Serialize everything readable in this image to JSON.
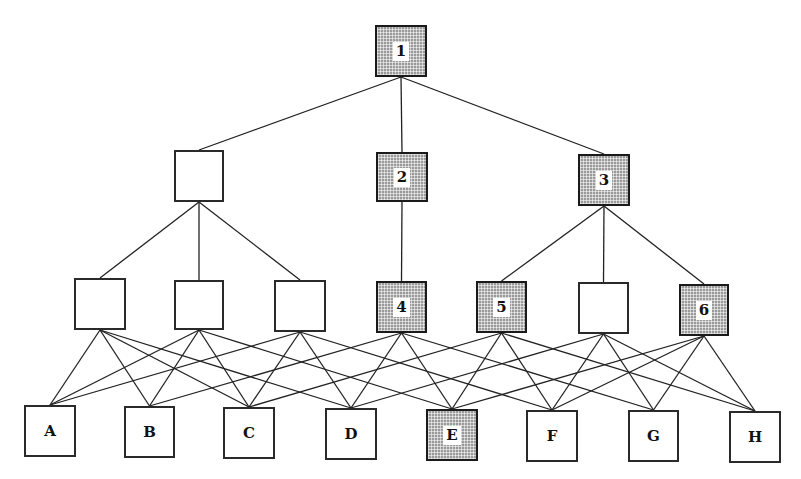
{
  "diagram": {
    "type": "hierarchy-graph",
    "colors": {
      "line": "#222222",
      "node_border": "#2a2a2a",
      "shaded_fill": "#9a9a9a",
      "plain_fill": "#ffffff"
    },
    "nodes": [
      {
        "id": "n1",
        "label": "1",
        "shaded": true,
        "x": 375,
        "y": 25,
        "w": 52,
        "h": 52
      },
      {
        "id": "m0",
        "label": "",
        "shaded": false,
        "x": 174,
        "y": 150,
        "w": 50,
        "h": 52
      },
      {
        "id": "n2",
        "label": "2",
        "shaded": true,
        "x": 376,
        "y": 152,
        "w": 52,
        "h": 50
      },
      {
        "id": "n3",
        "label": "3",
        "shaded": true,
        "x": 578,
        "y": 154,
        "w": 52,
        "h": 52
      },
      {
        "id": "l0",
        "label": "",
        "shaded": false,
        "x": 74,
        "y": 278,
        "w": 52,
        "h": 52
      },
      {
        "id": "l1",
        "label": "",
        "shaded": false,
        "x": 174,
        "y": 280,
        "w": 50,
        "h": 50
      },
      {
        "id": "l2",
        "label": "",
        "shaded": false,
        "x": 274,
        "y": 280,
        "w": 52,
        "h": 52
      },
      {
        "id": "n4",
        "label": "4",
        "shaded": true,
        "x": 376,
        "y": 281,
        "w": 51,
        "h": 52
      },
      {
        "id": "n5",
        "label": "5",
        "shaded": true,
        "x": 476,
        "y": 281,
        "w": 51,
        "h": 52
      },
      {
        "id": "l5",
        "label": "",
        "shaded": false,
        "x": 578,
        "y": 282,
        "w": 51,
        "h": 52
      },
      {
        "id": "n6",
        "label": "6",
        "shaded": true,
        "x": 679,
        "y": 284,
        "w": 50,
        "h": 52
      },
      {
        "id": "A",
        "label": "A",
        "shaded": false,
        "x": 24,
        "y": 405,
        "w": 52,
        "h": 52
      },
      {
        "id": "B",
        "label": "B",
        "shaded": false,
        "x": 124,
        "y": 406,
        "w": 51,
        "h": 52
      },
      {
        "id": "C",
        "label": "C",
        "shaded": false,
        "x": 223,
        "y": 407,
        "w": 52,
        "h": 52
      },
      {
        "id": "D",
        "label": "D",
        "shaded": false,
        "x": 325,
        "y": 408,
        "w": 52,
        "h": 52
      },
      {
        "id": "E",
        "label": "E",
        "shaded": true,
        "x": 426,
        "y": 409,
        "w": 52,
        "h": 52
      },
      {
        "id": "F",
        "label": "F",
        "shaded": false,
        "x": 526,
        "y": 410,
        "w": 52,
        "h": 52
      },
      {
        "id": "G",
        "label": "G",
        "shaded": false,
        "x": 628,
        "y": 410,
        "w": 51,
        "h": 52
      },
      {
        "id": "H",
        "label": "H",
        "shaded": false,
        "x": 729,
        "y": 411,
        "w": 52,
        "h": 52
      }
    ],
    "edges": [
      [
        "n1",
        "m0"
      ],
      [
        "n1",
        "n2"
      ],
      [
        "n1",
        "n3"
      ],
      [
        "m0",
        "l0"
      ],
      [
        "m0",
        "l1"
      ],
      [
        "m0",
        "l2"
      ],
      [
        "n2",
        "n4"
      ],
      [
        "n3",
        "n5"
      ],
      [
        "n3",
        "l5"
      ],
      [
        "n3",
        "n6"
      ],
      [
        "l0",
        "A"
      ],
      [
        "l0",
        "B"
      ],
      [
        "l0",
        "C"
      ],
      [
        "l0",
        "D"
      ],
      [
        "l1",
        "A"
      ],
      [
        "l1",
        "B"
      ],
      [
        "l1",
        "C"
      ],
      [
        "l1",
        "E"
      ],
      [
        "l2",
        "A"
      ],
      [
        "l2",
        "C"
      ],
      [
        "l2",
        "D"
      ],
      [
        "l2",
        "F"
      ],
      [
        "n4",
        "B"
      ],
      [
        "n4",
        "D"
      ],
      [
        "n4",
        "E"
      ],
      [
        "n4",
        "G"
      ],
      [
        "n5",
        "C"
      ],
      [
        "n5",
        "E"
      ],
      [
        "n5",
        "F"
      ],
      [
        "n5",
        "H"
      ],
      [
        "l5",
        "D"
      ],
      [
        "l5",
        "F"
      ],
      [
        "l5",
        "G"
      ],
      [
        "l5",
        "H"
      ],
      [
        "n6",
        "E"
      ],
      [
        "n6",
        "F"
      ],
      [
        "n6",
        "G"
      ],
      [
        "n6",
        "H"
      ]
    ]
  }
}
